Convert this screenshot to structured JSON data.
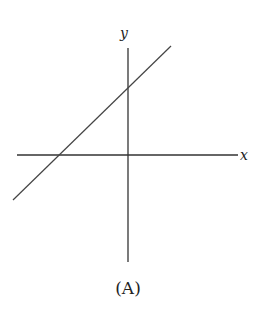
{
  "figure": {
    "caption": "(A)",
    "x_axis_label": "x",
    "y_axis_label": "y",
    "line_description": "straight line with positive slope, positive y-intercept and negative x-intercept"
  },
  "colors": {
    "stroke": "#333333",
    "background": "#ffffff"
  }
}
